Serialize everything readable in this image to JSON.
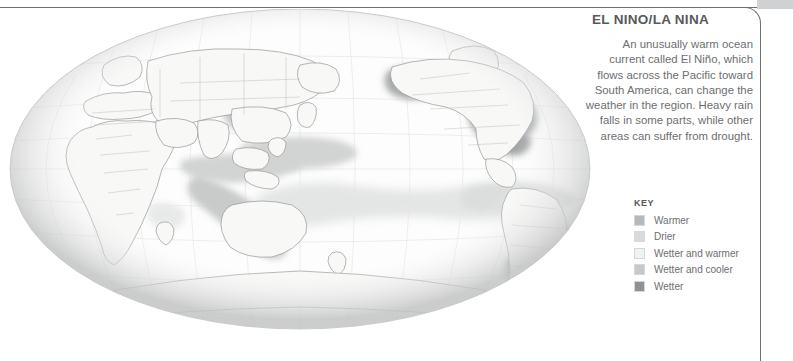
{
  "panel": {
    "title": "EL NINO/LA NINA",
    "body": "An unusually warm ocean current called El Niño, which flows across the Pacific toward South America, can change the weather in the region. Heavy rain falls in some parts, while other areas can suffer from drought."
  },
  "key": {
    "title": "KEY",
    "items": [
      {
        "label": "Warmer",
        "color": "#b7b9ba"
      },
      {
        "label": "Drier",
        "color": "#d8dadb"
      },
      {
        "label": "Wetter and warmer",
        "color": "#f1f2f2"
      },
      {
        "label": "Wetter and cooler",
        "color": "#c6c8c9"
      },
      {
        "label": "Wetter",
        "color": "#8f9193"
      }
    ]
  },
  "map": {
    "name": "world-globe-orthographic-pacific",
    "ocean_color": "#fdfdfd",
    "land_color": "#f7f7f6",
    "coast_color": "#8d8f90",
    "border_color": "#b9bbbc",
    "graticule_color": "#dcdedd",
    "limb_color": "#c9cbca",
    "overlay_light": "#e4e6e5",
    "overlay_mid": "#d2d4d3",
    "overlay_dark": "#a9abac",
    "regions": [
      {
        "name": "pacific-warm-band-north",
        "tone": "mid"
      },
      {
        "name": "pacific-equatorial-band",
        "tone": "light"
      },
      {
        "name": "indonesia-australia-band",
        "tone": "mid"
      },
      {
        "name": "north-america-patch",
        "tone": "dark"
      },
      {
        "name": "alaska-patch",
        "tone": "dark"
      },
      {
        "name": "brazil-patch",
        "tone": "dark"
      },
      {
        "name": "southern-south-america-patch",
        "tone": "dark"
      },
      {
        "name": "east-africa-patch",
        "tone": "light"
      },
      {
        "name": "southeast-asia-patch",
        "tone": "mid"
      }
    ]
  },
  "frame": {
    "rule_color": "#6e7072",
    "band_color": "#cfd1d2"
  }
}
